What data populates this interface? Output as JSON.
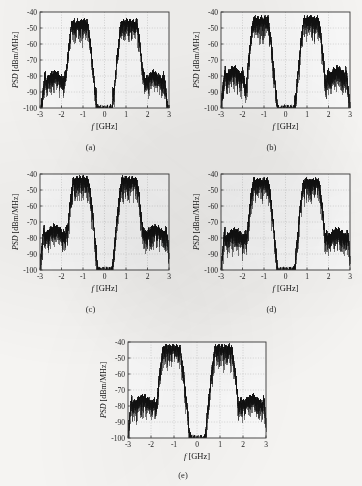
{
  "figure": {
    "background_color": "#fbfaf8",
    "trace_color": "#111111",
    "axis_color": "#3a3a3a",
    "grid_color": "#b8b8b8",
    "panel_labels": [
      "(a)",
      "(b)",
      "(c)",
      "(d)",
      "(e)"
    ]
  },
  "axes": {
    "xlabel": "f [GHz]",
    "ylabel": "PSD [dBm/MHz]",
    "xlabel_italic_part": "f",
    "xlabel_unit_part": "[GHz]",
    "ylabel_italic_part": "PSD",
    "ylabel_unit_part": "[dBm/MHz]",
    "xticks": [
      -3,
      -2,
      -1,
      0,
      1,
      2,
      3
    ],
    "xtick_labels": [
      "-3",
      "-2",
      "-1",
      "0",
      "1",
      "2",
      "3"
    ],
    "yticks": [
      -40,
      -50,
      -60,
      -70,
      -80,
      -90,
      -100
    ],
    "ytick_labels": [
      "-40",
      "-50",
      "-60",
      "-70",
      "-80",
      "-90",
      "-100"
    ],
    "xlim": [
      -3,
      3
    ],
    "ylim": [
      -100,
      -40
    ],
    "grid": true,
    "grid_style": "dotted"
  },
  "chart_data": [
    {
      "type": "line",
      "id": "a",
      "title": "(a)",
      "xlabel": "f [GHz]",
      "ylabel": "PSD [dBm/MHz]",
      "xlim": [
        -3,
        3
      ],
      "ylim": [
        -100,
        -40
      ],
      "legend": null,
      "grid": true,
      "description": "Power spectral density with two main lobes near -1.2 and +1.2 GHz peaking at -46 dBm/MHz, sidebands near -2.3 and +2.3 GHz peaking at -78 dBm/MHz, and narrow spurs near -0.4 and +0.4 GHz reaching -88 dBm/MHz.",
      "features": {
        "main_lobe_centers": [
          -1.15,
          1.15
        ],
        "main_lobe_peak": -46,
        "main_lobe_halfwidth": 0.35,
        "sideband_centers": [
          -2.3,
          2.3
        ],
        "sideband_peak": -78,
        "sideband_halfwidth": 0.45,
        "spur_centers": [
          -0.4,
          0.4
        ],
        "spur_peak": -88,
        "spur_halfwidth": 0.06,
        "noise_floor": -100,
        "skirt_depth": 14
      }
    },
    {
      "type": "line",
      "id": "b",
      "title": "(b)",
      "xlabel": "f [GHz]",
      "ylabel": "PSD [dBm/MHz]",
      "xlim": [
        -3,
        3
      ],
      "ylim": [
        -100,
        -40
      ],
      "legend": null,
      "grid": true,
      "description": "Two main lobes near -1.15 and +1.15 GHz peaking at -44 dBm/MHz, sidebands near -2.4 and +2.4 GHz peaking at -75 dBm/MHz, narrow spurs near -0.4 and +0.45 GHz at -92 dBm/MHz.",
      "features": {
        "main_lobe_centers": [
          -1.15,
          1.2
        ],
        "main_lobe_peak": -44,
        "main_lobe_halfwidth": 0.33,
        "sideband_centers": [
          -2.4,
          2.4
        ],
        "sideband_peak": -75,
        "sideband_halfwidth": 0.4,
        "spur_centers": [
          -0.42,
          0.45
        ],
        "spur_peak": -92,
        "spur_halfwidth": 0.05,
        "noise_floor": -100,
        "skirt_depth": 16
      }
    },
    {
      "type": "line",
      "id": "c",
      "title": "(c)",
      "xlabel": "f [GHz]",
      "ylabel": "PSD [dBm/MHz]",
      "xlim": [
        -3,
        3
      ],
      "ylim": [
        -100,
        -40
      ],
      "legend": null,
      "grid": true,
      "description": "Two main lobes near -1.1 and +1.15 GHz peaking at -43 dBm/MHz, broad sidebands near -2.3 and +2.35 GHz peaking at -73 dBm/MHz, narrow spurs near -0.4 and +0.45 GHz at -90 dBm/MHz.",
      "features": {
        "main_lobe_centers": [
          -1.1,
          1.15
        ],
        "main_lobe_peak": -43,
        "main_lobe_halfwidth": 0.34,
        "sideband_centers": [
          -2.3,
          2.35
        ],
        "sideband_peak": -73,
        "sideband_halfwidth": 0.5,
        "spur_centers": [
          -0.4,
          0.45
        ],
        "spur_peak": -90,
        "spur_halfwidth": 0.06,
        "noise_floor": -100,
        "skirt_depth": 15
      }
    },
    {
      "type": "line",
      "id": "d",
      "title": "(d)",
      "xlabel": "f [GHz]",
      "ylabel": "PSD [dBm/MHz]",
      "xlim": [
        -3,
        3
      ],
      "ylim": [
        -100,
        -40
      ],
      "legend": null,
      "grid": true,
      "description": "Two main lobes near -1.15 and +1.2 GHz peaking at -44 dBm/MHz, sidebands near -2.35 and +2.4 GHz peaking at -75 dBm/MHz, narrow spurs near -0.45 and +0.5 GHz at -90 dBm/MHz.",
      "features": {
        "main_lobe_centers": [
          -1.15,
          1.2
        ],
        "main_lobe_peak": -44,
        "main_lobe_halfwidth": 0.34,
        "sideband_centers": [
          -2.35,
          2.4
        ],
        "sideband_peak": -75,
        "sideband_halfwidth": 0.46,
        "spur_centers": [
          -0.45,
          0.5
        ],
        "spur_peak": -90,
        "spur_halfwidth": 0.06,
        "noise_floor": -100,
        "skirt_depth": 15
      }
    },
    {
      "type": "line",
      "id": "e",
      "title": "(e)",
      "xlabel": "f [GHz]",
      "ylabel": "PSD [dBm/MHz]",
      "xlim": [
        -3,
        3
      ],
      "ylim": [
        -100,
        -40
      ],
      "legend": null,
      "grid": true,
      "description": "Two main lobes near -1.1 and +1.15 GHz peaking at -43 dBm/MHz, sidebands near -2.35 and +2.4 GHz peaking at -74 dBm/MHz, narrow spurs near -0.4 and +0.45 GHz at -87 dBm/MHz.",
      "features": {
        "main_lobe_centers": [
          -1.1,
          1.15
        ],
        "main_lobe_peak": -43,
        "main_lobe_halfwidth": 0.35,
        "sideband_centers": [
          -2.35,
          2.4
        ],
        "sideband_peak": -74,
        "sideband_halfwidth": 0.47,
        "spur_centers": [
          -0.4,
          0.45
        ],
        "spur_peak": -87,
        "spur_halfwidth": 0.07,
        "noise_floor": -100,
        "skirt_depth": 15
      }
    }
  ]
}
